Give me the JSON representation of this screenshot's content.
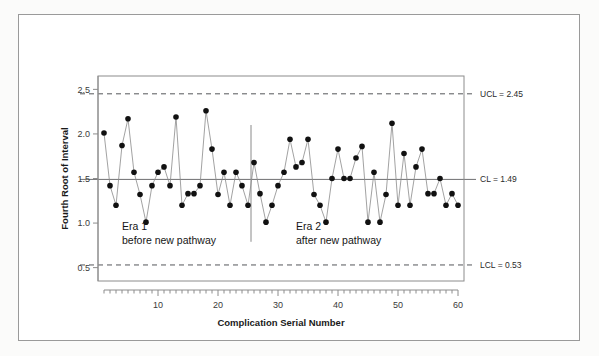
{
  "chart_data": {
    "type": "line",
    "title": "",
    "xlabel": "Complication Serial Number",
    "ylabel": "Fourth Root of Interval",
    "xlim": [
      1,
      60
    ],
    "ylim": [
      0.35,
      2.65
    ],
    "grid": false,
    "legend_position": "none",
    "x_ticks": [
      10,
      20,
      30,
      40,
      50,
      60
    ],
    "x_tick_labels": [
      "10",
      "20",
      "30",
      "40",
      "50",
      "60"
    ],
    "x_minor_tick_step": 1,
    "y_ticks": [
      0.5,
      1.0,
      1.5,
      2.0,
      2.5
    ],
    "y_tick_labels": [
      "0.5",
      "1.0",
      "1.5",
      "2.0",
      "2.5"
    ],
    "marker": "filled-circle",
    "x": [
      1,
      2,
      3,
      4,
      5,
      6,
      7,
      8,
      9,
      10,
      11,
      12,
      13,
      14,
      15,
      16,
      17,
      18,
      19,
      20,
      21,
      22,
      23,
      24,
      25,
      26,
      27,
      28,
      29,
      30,
      31,
      32,
      33,
      34,
      35,
      36,
      37,
      38,
      39,
      40,
      41,
      42,
      43,
      44,
      45,
      46,
      47,
      48,
      49,
      50,
      51,
      52,
      53,
      54,
      55,
      56,
      57,
      58,
      59,
      60
    ],
    "values": [
      2.01,
      1.42,
      1.2,
      1.87,
      2.17,
      1.57,
      1.32,
      1.01,
      1.42,
      1.57,
      1.63,
      1.42,
      2.19,
      1.2,
      1.33,
      1.33,
      1.42,
      2.26,
      1.83,
      1.32,
      1.57,
      1.2,
      1.57,
      1.42,
      1.2,
      1.68,
      1.33,
      1.01,
      1.2,
      1.42,
      1.57,
      1.94,
      1.63,
      1.68,
      1.94,
      1.32,
      1.2,
      1.01,
      1.5,
      1.83,
      1.5,
      1.5,
      1.73,
      1.86,
      1.01,
      1.57,
      1.01,
      1.32,
      2.12,
      1.2,
      1.78,
      1.2,
      1.63,
      1.83,
      1.33,
      1.33,
      1.5,
      1.2,
      1.33,
      1.2
    ],
    "control_limits": {
      "ucl": {
        "value": 2.45,
        "label": "UCL = 2.45",
        "style": "dashed"
      },
      "cl": {
        "value": 1.49,
        "label": "CL = 1.49",
        "style": "solid"
      },
      "lcl": {
        "value": 0.53,
        "label": "LCL = 0.53",
        "style": "dashed"
      }
    },
    "phase_divider": {
      "after_x": 25.5,
      "style": "solid"
    },
    "annotations": [
      {
        "name": "era-1",
        "line1": "Era 1",
        "line2": "before new pathway",
        "x": 4,
        "y": 0.92
      },
      {
        "name": "era-2",
        "line1": "Era 2",
        "line2": "after new pathway",
        "x": 33,
        "y": 0.92
      }
    ]
  }
}
